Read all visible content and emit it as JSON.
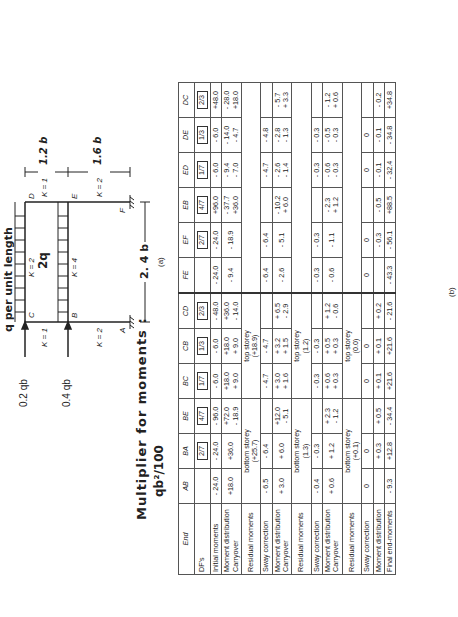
{
  "diagram": {
    "load_label": "q  per  unit  length",
    "beam_load_label": "2q",
    "left_loads": [
      "0.2 qb",
      "0.4 qb"
    ],
    "nodes": [
      "A",
      "B",
      "C",
      "D",
      "E",
      "F"
    ],
    "stiffness": {
      "CD": "K = 2",
      "BE": "K = 4",
      "BC": "K = 1",
      "AB": "K = 2",
      "DE": "K = 1",
      "EF": "K = 2"
    },
    "dims": {
      "span": "2. 4 b",
      "upper_height": "1.2 b",
      "lower_height": "1.6 b"
    },
    "caption": "(a)"
  },
  "title": {
    "line1": "Multiplier  for  moments :",
    "line2": "qb²/100"
  },
  "table": {
    "caption": "(b)",
    "columns": [
      "End",
      "AB",
      "BA",
      "BE",
      "BC",
      "CB",
      "CD",
      "FE",
      "EF",
      "EB",
      "ED",
      "DE",
      "DC"
    ],
    "rows": [
      {
        "label": "DF's",
        "cells": [
          "",
          "2/7",
          "4/7",
          "1/7",
          "1/3",
          "2/3",
          "",
          "2/7",
          "4/7",
          "1/7",
          "1/3",
          "2/3"
        ]
      },
      {
        "label": "Initial moments",
        "cells": [
          "- 24.0",
          "- 24.0",
          "- 96.0",
          "- 6.0",
          "- 6.0",
          "- 48.0",
          "- 24.0",
          "- 24.0",
          "+96.0",
          "- 6.0",
          "- 6.0",
          "+48.0"
        ]
      },
      {
        "label": "Moment distribution\nCarryover",
        "cells": [
          "+18.0",
          "+36.0",
          "+72.0\n- 18.9",
          "+18.0\n+ 9.0",
          "+18.0\n+ 9.0",
          "+36.0\n- 14.0",
          "- 9.4",
          "- 18.9",
          "- 37.7\n+36.0",
          "- 9.4\n- 7.0",
          "- 14.0\n- 4.7",
          "- 28.0\n+18.0"
        ]
      },
      {
        "label": "Residual moments",
        "spans": [
          {
            "text": "bottom storey\n(+25.7)",
            "cols": 3
          },
          {
            "text": "top storey\n(+18.9)",
            "cols": 3
          },
          {
            "text": "",
            "cols": 6
          }
        ]
      },
      {
        "label": "Sway correction",
        "cells": [
          "- 6.5",
          "- 6.4",
          "",
          "- 4.7",
          "- 4.7",
          "",
          "- 6.4",
          "- 6.4",
          "",
          "- 4.7",
          "- 4.8",
          ""
        ]
      },
      {
        "label": "Moment distribution\nCarryover",
        "cells": [
          "+ 3.0",
          "+ 6.0",
          "+12.0\n- 5.1",
          "+ 3.0\n+ 1.6",
          "+ 3.2\n+ 1.5",
          "+ 6.5\n- 2.9",
          "- 2.6",
          "- 5.1",
          "- 10.2\n+ 6.0",
          "- 2.6\n- 1.4",
          "- 2.8\n- 1.3",
          "- 5.7\n+ 3.3"
        ]
      },
      {
        "label": "Residual moments",
        "spans": [
          {
            "text": "bottom storey\n(1.3)",
            "cols": 3
          },
          {
            "text": "top storey\n(1.2)",
            "cols": 3
          },
          {
            "text": "",
            "cols": 6
          }
        ]
      },
      {
        "label": "Sway correction",
        "cells": [
          "- 0.4",
          "- 0.3",
          "",
          "- 0.3",
          "- 0.3",
          "",
          "- 0.3",
          "- 0.3",
          "",
          "- 0.3",
          "- 0.3",
          ""
        ]
      },
      {
        "label": "Moment distribution\nCarryover",
        "cells": [
          "+ 0.6",
          "+ 1.2",
          "+ 2.3\n- 1.2",
          "+ 0.6\n+ 0.3",
          "+ 0.5\n+ 0.3",
          "+ 1.2\n- 0.6",
          "- 0.6",
          "- 1.1",
          "- 2.3\n+ 1.2",
          "- 0.6\n- 0.3",
          "- 0.5\n- 0.3",
          "- 1.2\n+ 0.6"
        ]
      },
      {
        "label": "Residual moments",
        "spans": [
          {
            "text": "bottom storey\n(+0.1)",
            "cols": 3
          },
          {
            "text": "top storey\n(0.0)",
            "cols": 3
          },
          {
            "text": "",
            "cols": 6
          }
        ]
      },
      {
        "label": "Sway correction",
        "cells": [
          "0",
          "0",
          "",
          "0",
          "0",
          "",
          "0",
          "0",
          "",
          "0",
          "0",
          ""
        ]
      },
      {
        "label": "Moment distribution",
        "cells": [
          "",
          "+ 0.3",
          "+ 0.5",
          "+ 0.1",
          "+ 0.1",
          "+ 0.2",
          "",
          "- 0.3",
          "- 0.5",
          "- 0.1",
          "- 0.1",
          "- 0.2"
        ]
      },
      {
        "label": "Final end-moments",
        "cells": [
          "- 9.3",
          "+12.8",
          "- 34.4",
          "+21.6",
          "+21.6",
          "- 21.6",
          "- 43.3",
          "- 56.1",
          "+88.5",
          "- 32.4",
          "- 34.8",
          "+34.8"
        ]
      }
    ]
  }
}
